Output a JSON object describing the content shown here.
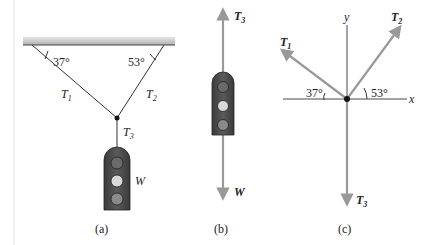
{
  "figure": {
    "panel_a": {
      "caption": "(a)",
      "angle_left": "37°",
      "angle_right": "53°",
      "tension_1": "T",
      "tension_1_sub": "1",
      "tension_2": "T",
      "tension_2_sub": "2",
      "tension_3": "T",
      "tension_3_sub": "3",
      "weight_label": "W"
    },
    "panel_b": {
      "caption": "(b)",
      "up_force": "T",
      "up_force_sub": "3",
      "down_force": "W"
    },
    "panel_c": {
      "caption": "(c)",
      "axis_x": "x",
      "axis_y": "y",
      "t1": "T",
      "t1_sub": "1",
      "t2": "T",
      "t2_sub": "2",
      "t3": "T",
      "t3_sub": "3",
      "angle_left": "37°",
      "angle_right": "53°"
    },
    "colors": {
      "ceiling": "#b8b8b8",
      "vector": "#999999",
      "traffic_light_body": "#4a4a4a",
      "lamp_dark": "#6a6a6a",
      "lamp_light": "#d8d8d8"
    }
  }
}
